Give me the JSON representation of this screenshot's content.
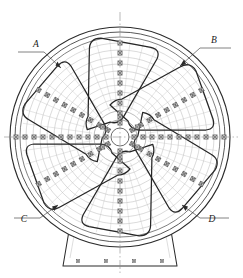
{
  "drawing": {
    "title": "Spoked wheel plan view",
    "type": "mechanical-engineering-plan",
    "background_color": "#ffffff",
    "line_color": "#2b2b2b",
    "thin_line_color": "#9a9a9a",
    "centerline_color": "#8c8c8c",
    "fastener_color": "#7d7d7d"
  },
  "callouts": [
    {
      "id": "A",
      "label": "A",
      "position": "top-left",
      "text_x": 36,
      "text_y": 47,
      "leader": "M 18 52 L 44 52 L 61 68"
    },
    {
      "id": "B",
      "label": "B",
      "position": "top-right",
      "text_x": 214,
      "text_y": 43,
      "leader": "M 231 48 L 200 48 L 180 66"
    },
    {
      "id": "C",
      "label": "C",
      "position": "bottom-left",
      "text_x": 24,
      "text_y": 222,
      "leader": "M 14 218 L 40 218 L 58 205"
    },
    {
      "id": "D",
      "label": "D",
      "position": "bottom-right",
      "text_x": 212,
      "text_y": 222,
      "leader": "M 229 218 L 200 218 L 182 205"
    }
  ],
  "geometry": {
    "center_x": 120,
    "center_y": 137,
    "rim_radii": [
      110,
      105,
      100
    ],
    "hub_radii": [
      26,
      18,
      9
    ],
    "spoke_count": 6,
    "spoke_angles_deg": [
      90,
      30,
      330,
      270,
      210,
      150
    ],
    "web_sector_count": 6,
    "contour_arc_count": 9
  },
  "fasteners": {
    "marker_type": "square-with-cross",
    "marker_size": 4.2,
    "spoke_row_counts": {
      "horizontal_left": 11,
      "horizontal_right": 11,
      "vertical_up": 9,
      "vertical_down": 9,
      "diagonal": 9
    },
    "base_bolt_count": 4,
    "hub_ring_count": 6
  },
  "base": {
    "shape": "trapezoid-foot",
    "top_left_x": 70,
    "top_right_x": 170,
    "bottom_left_x": 63,
    "bottom_right_x": 177,
    "top_y": 231,
    "bottom_y": 266,
    "bolt_xs": [
      78,
      106,
      134,
      162
    ],
    "bolt_y": 261
  },
  "centerlines": {
    "vertical": {
      "x": 120,
      "y1": 12,
      "y2": 274
    },
    "horizontal": {
      "y": 137,
      "x1": 4,
      "x2": 238
    }
  }
}
